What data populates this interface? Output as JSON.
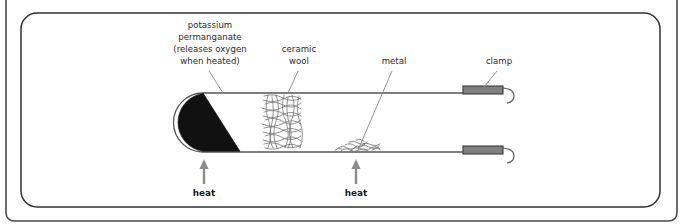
{
  "figure": {
    "background_color": "#ffffff",
    "frame_color": "#2f2f2f",
    "tube_line_color": "#555555",
    "reagent_color": "#111111",
    "clamp_color": "#808080",
    "clamp_border_color": "#3a3a3a",
    "arrow_color": "#8c8c8c",
    "leader_color": "#8a8a8a",
    "wool_color": "#6e6e6e",
    "metal_color": "#707070"
  },
  "labels": {
    "potassium": {
      "line1": "potassium",
      "line2": "permanganate",
      "line3": "(releases oxygen",
      "line4": "when heated)"
    },
    "ceramic": {
      "line1": "ceramic",
      "line2": "wool"
    },
    "metal": {
      "line1": "metal"
    },
    "clamp": {
      "line1": "clamp"
    },
    "heat_left": "heat",
    "heat_right": "heat"
  },
  "diagram_parts": [
    {
      "name": "test-tube",
      "description": "horizontal test tube, rounded closed left end, open right end"
    },
    {
      "name": "potassium-permanganate",
      "description": "black solid packed in the closed left end"
    },
    {
      "name": "ceramic-wool",
      "description": "tangled fibrous plug in the middle of the tube"
    },
    {
      "name": "metal-filings",
      "description": "thin layer of metal lying on the tube floor"
    },
    {
      "name": "clamp-top",
      "description": "grey clamp gripping the upper tube wall near the open end"
    },
    {
      "name": "clamp-bottom",
      "description": "grey clamp gripping the lower tube wall near the open end"
    },
    {
      "name": "heat-arrow-left",
      "description": "upward arrow under the potassium permanganate"
    },
    {
      "name": "heat-arrow-right",
      "description": "upward arrow under the metal filings"
    }
  ]
}
